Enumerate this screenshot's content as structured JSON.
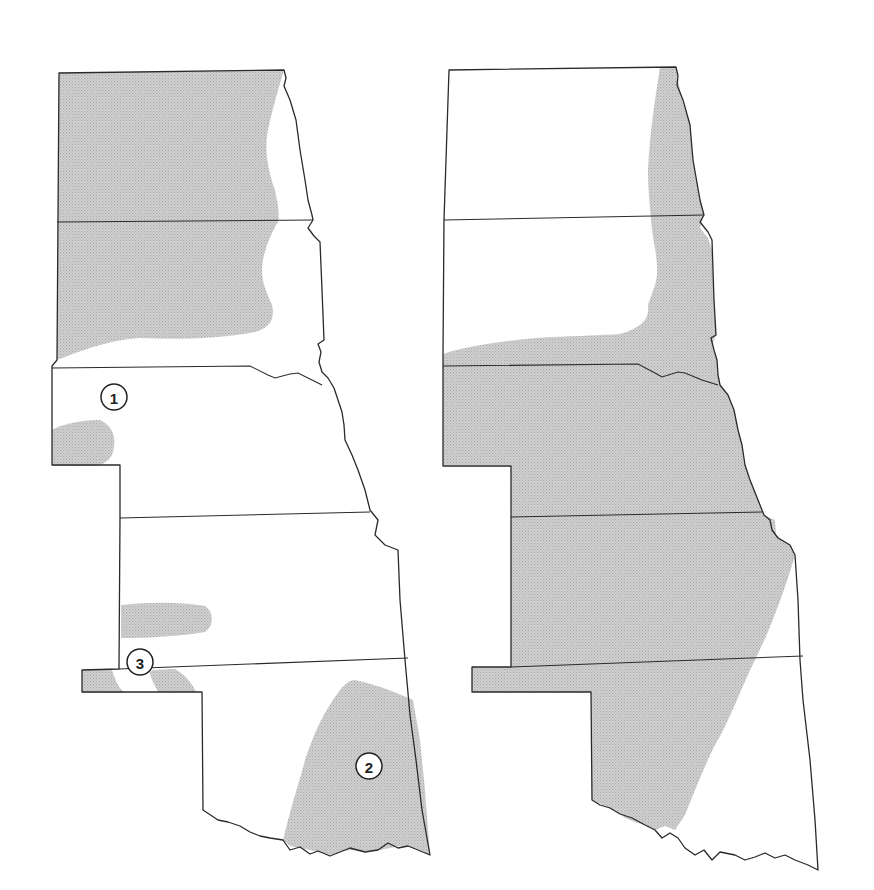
{
  "figure": {
    "panels": [
      {
        "id": "left-map",
        "description": "Great Plains states (North Dakota, South Dakota, Nebraska, Kansas, Oklahoma) with scattered shaded regions",
        "labels": [
          {
            "number": "1",
            "x": 114,
            "y": 397
          },
          {
            "number": "2",
            "x": 369,
            "y": 766
          },
          {
            "number": "3",
            "x": 140,
            "y": 662
          }
        ]
      },
      {
        "id": "right-map",
        "description": "Great Plains states with large shaded region covering eastern Dakotas, most of Nebraska, Kansas and western Oklahoma",
        "labels": []
      }
    ],
    "colors": {
      "outline": "#2a2a2a",
      "shading": "#c8c8c8",
      "background": "#ffffff"
    }
  }
}
